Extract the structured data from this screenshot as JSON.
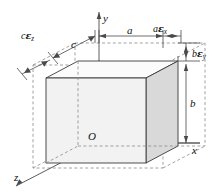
{
  "figure": {
    "background_color": "#ffffff",
    "width": 215,
    "height": 194
  },
  "axes": {
    "y_label": "y",
    "x_label": "x",
    "z_label": "z",
    "origin_label": "O"
  },
  "dimensions": {
    "a_label": "a",
    "b_label": "b",
    "c_label": "c"
  },
  "strains": {
    "x_label_base": "a",
    "x_label_eps": "ε",
    "x_label_sub": "x",
    "y_label_base": "b",
    "y_label_eps": "ε",
    "y_label_sub": "y",
    "z_label_base": "c",
    "z_label_eps": "ε",
    "z_label_sub": "z"
  },
  "colors": {
    "line": "#3a3a3a",
    "dashed": "#8a8a8a",
    "front_face": "#f2f2f2",
    "right_face": "#d9d9d9",
    "top_face": "#fbfbfb",
    "text": "#111111"
  }
}
